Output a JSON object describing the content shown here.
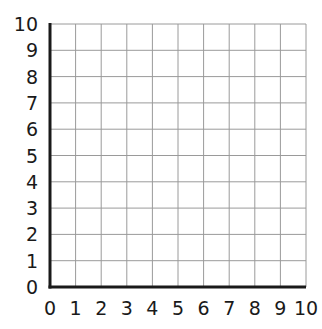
{
  "chart_data": {
    "type": "scatter",
    "title": "",
    "xlabel": "",
    "ylabel": "",
    "xlim": [
      0,
      10
    ],
    "ylim": [
      0,
      10
    ],
    "x_ticks": [
      "0",
      "1",
      "2",
      "3",
      "4",
      "5",
      "6",
      "7",
      "8",
      "9",
      "10"
    ],
    "y_ticks": [
      "0",
      "1",
      "2",
      "3",
      "4",
      "5",
      "6",
      "7",
      "8",
      "9",
      "10"
    ],
    "grid": true,
    "series": [],
    "legend": null
  },
  "style": {
    "axis_color": "#1a1a1a",
    "grid_color": "#9a9a9a",
    "background": "#ffffff"
  }
}
